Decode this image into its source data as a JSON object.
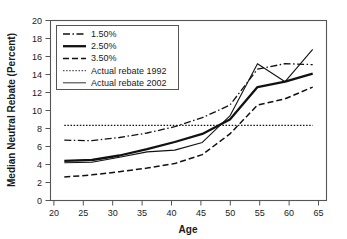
{
  "chart_data": {
    "type": "line",
    "title": "",
    "xlabel": "Age",
    "ylabel": "Median Neutral Rebate (Percent)",
    "xlim": [
      17.5,
      67.5
    ],
    "ylim": [
      0,
      20
    ],
    "xticks": [
      20,
      25,
      30,
      35,
      40,
      45,
      50,
      55,
      60,
      65
    ],
    "yticks": [
      0,
      2,
      4,
      6,
      8,
      10,
      12,
      14,
      16,
      18,
      20
    ],
    "grid": false,
    "legend_position": "upper-left",
    "x": [
      20,
      25,
      30,
      35,
      40,
      45,
      50,
      55,
      60,
      65
    ],
    "series": [
      {
        "name": "1.50%",
        "style": "dashdot",
        "width": 1.3,
        "color": "#111111",
        "values": [
          6.7,
          6.65,
          7.0,
          7.5,
          8.2,
          9.2,
          10.6,
          14.6,
          15.2,
          15.1
        ]
      },
      {
        "name": "2.50%",
        "style": "solid-thick",
        "width": 2.3,
        "color": "#111111",
        "values": [
          4.4,
          4.5,
          5.0,
          5.7,
          6.5,
          7.4,
          9.0,
          12.6,
          13.2,
          14.1
        ]
      },
      {
        "name": "3.50%",
        "style": "dashed",
        "width": 1.5,
        "color": "#111111",
        "values": [
          2.6,
          2.85,
          3.2,
          3.6,
          4.1,
          5.1,
          7.4,
          10.6,
          11.3,
          12.6
        ]
      },
      {
        "name": "Actual rebate 1992",
        "style": "dotted",
        "width": 1.2,
        "color": "#555555",
        "values": [
          8.35,
          8.35,
          8.35,
          8.35,
          8.35,
          8.35,
          8.35,
          8.35,
          8.35,
          8.35
        ]
      },
      {
        "name": "Actual rebate 2002",
        "style": "solid-thin",
        "width": 1.1,
        "color": "#444444",
        "values": [
          4.2,
          4.25,
          4.8,
          5.4,
          5.6,
          6.45,
          9.4,
          15.2,
          13.2,
          16.8
        ]
      }
    ]
  },
  "axes": {
    "x_title": "Age",
    "y_title": "Median Neutral Rebate (Percent)",
    "x_tick_labels": [
      "20",
      "25",
      "30",
      "35",
      "40",
      "45",
      "50",
      "55",
      "60",
      "65"
    ],
    "y_tick_labels": [
      "0",
      "2",
      "4",
      "6",
      "8",
      "10",
      "12",
      "14",
      "16",
      "18",
      "20"
    ]
  },
  "legend": {
    "entries": [
      {
        "label": "1.50%"
      },
      {
        "label": "2.50%"
      },
      {
        "label": "3.50%"
      },
      {
        "label": "Actual rebate 1992"
      },
      {
        "label": "Actual rebate 2002"
      }
    ]
  }
}
